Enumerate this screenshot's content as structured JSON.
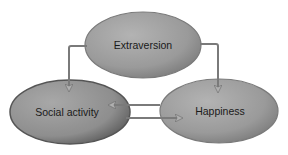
{
  "diagram": {
    "nodes": [
      {
        "id": "extraversion",
        "label": "Extraversion"
      },
      {
        "id": "social_activity",
        "label": "Social activity"
      },
      {
        "id": "happiness",
        "label": "Happiness"
      }
    ],
    "edges": [
      {
        "from": "extraversion",
        "to": "social_activity"
      },
      {
        "from": "extraversion",
        "to": "happiness"
      },
      {
        "from": "happiness",
        "to": "social_activity"
      },
      {
        "from": "social_activity",
        "to": "happiness"
      }
    ],
    "colors": {
      "node_fill": "#9c9c9c",
      "node_edge": "#6e6e6e",
      "arrow": "#7a7a7a",
      "arrowhead": "#b8b8b8"
    }
  }
}
